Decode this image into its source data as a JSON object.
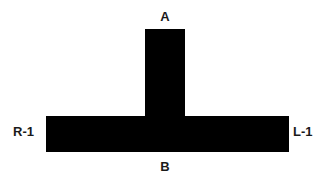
{
  "figure": {
    "background_color": "#ffffff",
    "shape_color": "#000000",
    "label_color": "#1a1a1a",
    "width": 330,
    "height": 184
  },
  "labels": {
    "top": "A",
    "bottom": "B",
    "left": "R-1",
    "right": "L-1"
  },
  "shape": {
    "name": "t-shape",
    "stem": {
      "x": 145,
      "y": 29,
      "width": 40,
      "height": 87
    },
    "bar": {
      "x": 46,
      "y": 116,
      "width": 243,
      "height": 36
    },
    "points": "145,29 185,29 185,116 289,116 289,152 46,152 46,116 145,116"
  }
}
